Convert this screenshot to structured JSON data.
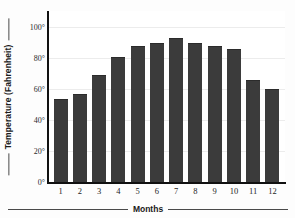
{
  "chart_data": {
    "type": "bar",
    "title": "",
    "xlabel": "Months",
    "ylabel": "Temperature (Fahrenheit)",
    "categories": [
      "1",
      "2",
      "3",
      "4",
      "5",
      "6",
      "7",
      "8",
      "9",
      "10",
      "11",
      "12"
    ],
    "values": [
      53,
      56,
      68,
      80,
      87,
      89,
      92,
      89,
      87,
      85,
      65,
      59
    ],
    "ylim": [
      0,
      110
    ],
    "y_ticks": [
      0,
      20,
      40,
      60,
      80,
      100
    ],
    "y_tick_labels": [
      "0°",
      "20°",
      "40°",
      "60°",
      "80°",
      "100°"
    ],
    "grid": true,
    "legend": "none",
    "bar_color": "#3b3b3b",
    "axis_color": "#111111",
    "grid_color": "#ececec",
    "background": "#ffffff"
  },
  "axes": {
    "y_title": "Temperature (Fahrenheit)",
    "x_title": "Months"
  }
}
